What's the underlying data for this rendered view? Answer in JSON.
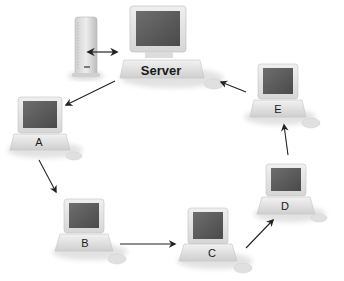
{
  "diagram": {
    "type": "token-ring network",
    "nodes": [
      {
        "id": "server",
        "label": "Server"
      },
      {
        "id": "A",
        "label": "A"
      },
      {
        "id": "B",
        "label": "B"
      },
      {
        "id": "C",
        "label": "C"
      },
      {
        "id": "D",
        "label": "D"
      },
      {
        "id": "E",
        "label": "E"
      }
    ],
    "edges": [
      {
        "from": "tower",
        "to": "server",
        "direction": "bidirectional"
      },
      {
        "from": "server",
        "to": "A"
      },
      {
        "from": "A",
        "to": "B"
      },
      {
        "from": "B",
        "to": "C"
      },
      {
        "from": "C",
        "to": "D"
      },
      {
        "from": "D",
        "to": "E"
      },
      {
        "from": "E",
        "to": "server"
      }
    ]
  },
  "labels": {
    "server": "Server",
    "a": "A",
    "b": "B",
    "c": "C",
    "d": "D",
    "e": "E"
  }
}
